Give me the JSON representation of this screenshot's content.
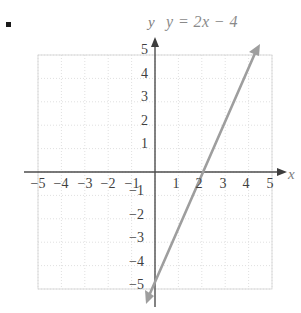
{
  "figure": {
    "bullet": "▪",
    "title": "y = 2x − 4",
    "axis_label_y": "y",
    "axis_label_x": "x",
    "line_color": "#9e9e9e",
    "axis_color": "#4d4d4d",
    "grid_color": "#e2e2e2"
  },
  "chart_data": {
    "type": "line",
    "title": "y = 2x − 4",
    "xlabel": "x",
    "ylabel": "y",
    "xlim": [
      -5,
      5
    ],
    "ylim": [
      -5,
      5
    ],
    "grid": true,
    "grid_style": "dotted",
    "legend": "none",
    "xticks": [
      -5,
      -4,
      -3,
      -2,
      -1,
      1,
      2,
      3,
      4,
      5
    ],
    "yticks": [
      5,
      4,
      3,
      2,
      1,
      -1,
      -2,
      -3,
      -4,
      -5
    ],
    "xtick_labels": [
      "−5",
      "−4",
      "−3",
      "−2",
      "−1",
      "1",
      "2",
      "3",
      "4",
      "5"
    ],
    "ytick_labels": [
      "5",
      "4",
      "3",
      "2",
      "1",
      "−1",
      "−2",
      "−3",
      "−4",
      "−5"
    ],
    "series": [
      {
        "name": "y = 2x − 4",
        "equation": "y = 2x - 4",
        "slope": 2,
        "intercept": -4,
        "x_intercept": 2,
        "y_intercept": -4,
        "points": [
          [
            -0.5,
            -5
          ],
          [
            4.5,
            5
          ]
        ],
        "arrows": "both",
        "color": "#9e9e9e"
      }
    ],
    "annotations": [
      {
        "text": "y = 2x − 4",
        "position": "top",
        "style": "italic"
      }
    ]
  },
  "ticks": {
    "x": [
      {
        "label": "−5",
        "left": 27,
        "top": 176
      },
      {
        "label": "−4",
        "left": 50,
        "top": 176
      },
      {
        "label": "−3",
        "left": 74,
        "top": 176
      },
      {
        "label": "−2",
        "left": 97,
        "top": 176
      },
      {
        "label": "−1",
        "left": 121,
        "top": 176
      },
      {
        "label": "1",
        "left": 165,
        "top": 176
      },
      {
        "label": "2",
        "left": 188,
        "top": 176
      },
      {
        "label": "3",
        "left": 212,
        "top": 176
      },
      {
        "label": "4",
        "left": 235,
        "top": 176
      },
      {
        "label": "5",
        "left": 259,
        "top": 176
      }
    ],
    "y": [
      {
        "label": "5",
        "left": 126,
        "top": 42
      },
      {
        "label": "4",
        "left": 126,
        "top": 66
      },
      {
        "label": "3",
        "left": 126,
        "top": 89
      },
      {
        "label": "2",
        "left": 126,
        "top": 113
      },
      {
        "label": "1",
        "left": 126,
        "top": 136
      },
      {
        "label": "−1",
        "left": 122,
        "top": 183
      },
      {
        "label": "−2",
        "left": 122,
        "top": 207
      },
      {
        "label": "−3",
        "left": 122,
        "top": 230
      },
      {
        "label": "−4",
        "left": 122,
        "top": 254
      },
      {
        "label": "−5",
        "left": 122,
        "top": 277
      }
    ]
  }
}
